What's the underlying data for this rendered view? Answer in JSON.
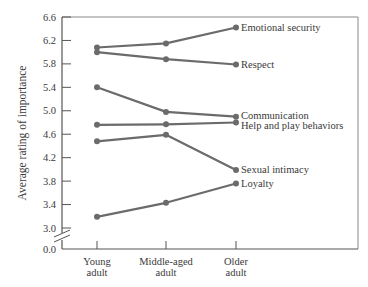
{
  "chart_data": {
    "type": "line",
    "title": "",
    "xlabel": "",
    "ylabel": "Average rating of importance",
    "categories": [
      "Young adult",
      "Middle-aged adult",
      "Older adult"
    ],
    "category_lines": [
      [
        "Young",
        "adult"
      ],
      [
        "Middle-aged",
        "adult"
      ],
      [
        "Older",
        "adult"
      ]
    ],
    "yticks": [
      "6.6",
      "6.2",
      "5.8",
      "5.4",
      "5.0",
      "4.6",
      "4.2",
      "3.8",
      "3.4",
      "3.0",
      "0.0"
    ],
    "ylim": [
      3.0,
      6.6
    ],
    "axis_break": true,
    "grid": false,
    "legend_position": "inline-right",
    "series": [
      {
        "name": "Emotional security",
        "values": [
          6.08,
          6.15,
          6.42
        ]
      },
      {
        "name": "Respect",
        "values": [
          6.0,
          5.88,
          5.79
        ]
      },
      {
        "name": "Communication",
        "values": [
          5.4,
          4.98,
          4.9
        ]
      },
      {
        "name": "Help and play behaviors",
        "values": [
          4.76,
          4.77,
          4.8
        ]
      },
      {
        "name": "Sexual intimacy",
        "values": [
          4.48,
          4.59,
          3.99
        ]
      },
      {
        "name": "Loyalty",
        "values": [
          3.19,
          3.43,
          3.76
        ]
      }
    ],
    "colors": {
      "line": "#6b6b6b",
      "axis": "#555555",
      "text": "#3a3a3a"
    }
  }
}
